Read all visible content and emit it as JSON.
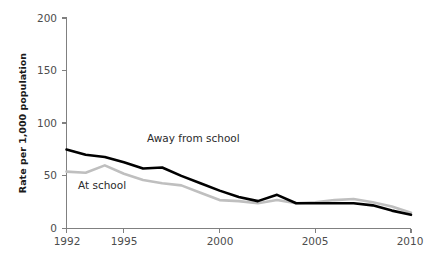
{
  "chart_data": {
    "type": "line",
    "title": "",
    "xlabel": "",
    "ylabel": "Rate per 1,000 population",
    "xlim": [
      1992,
      2010
    ],
    "ylim": [
      0,
      200
    ],
    "yticks": [
      0,
      50,
      100,
      150,
      200
    ],
    "ytick_labels": [
      "0",
      "50",
      "100",
      "150",
      "200"
    ],
    "xticks": [
      1992,
      1995,
      2000,
      2005,
      2010
    ],
    "xtick_labels": [
      "1992",
      "1995",
      "2000",
      "2005",
      "2010"
    ],
    "grid": false,
    "legend_position": "inline-annotations",
    "x": [
      1992,
      1993,
      1994,
      1995,
      1996,
      1997,
      1998,
      1999,
      2000,
      2001,
      2002,
      2003,
      2004,
      2005,
      2006,
      2007,
      2008,
      2009,
      2010
    ],
    "series": [
      {
        "name": "Away from school",
        "color": "#000000",
        "label_x": 1996.2,
        "label_y": 82,
        "values": [
          75,
          70,
          68,
          63,
          57,
          58,
          50,
          43,
          36,
          30,
          26,
          32,
          24,
          24,
          24,
          24,
          22,
          17,
          13
        ]
      },
      {
        "name": "At school",
        "color": "#bfbfbf",
        "label_x": 1992.6,
        "label_y": 38,
        "values": [
          54,
          53,
          60,
          52,
          46,
          43,
          41,
          34,
          27,
          26,
          24,
          27,
          24,
          25,
          27,
          28,
          25,
          21,
          15
        ]
      }
    ],
    "annotations": [
      {
        "text": "Away from school",
        "series": "Away from school"
      },
      {
        "text": "At school",
        "series": "At school"
      }
    ]
  },
  "figure": {
    "background_color": "#ffffff",
    "axis_color": "#808080",
    "tick_label_color": "#4d4d4d",
    "axis_title_color": "#1a1a1a"
  }
}
